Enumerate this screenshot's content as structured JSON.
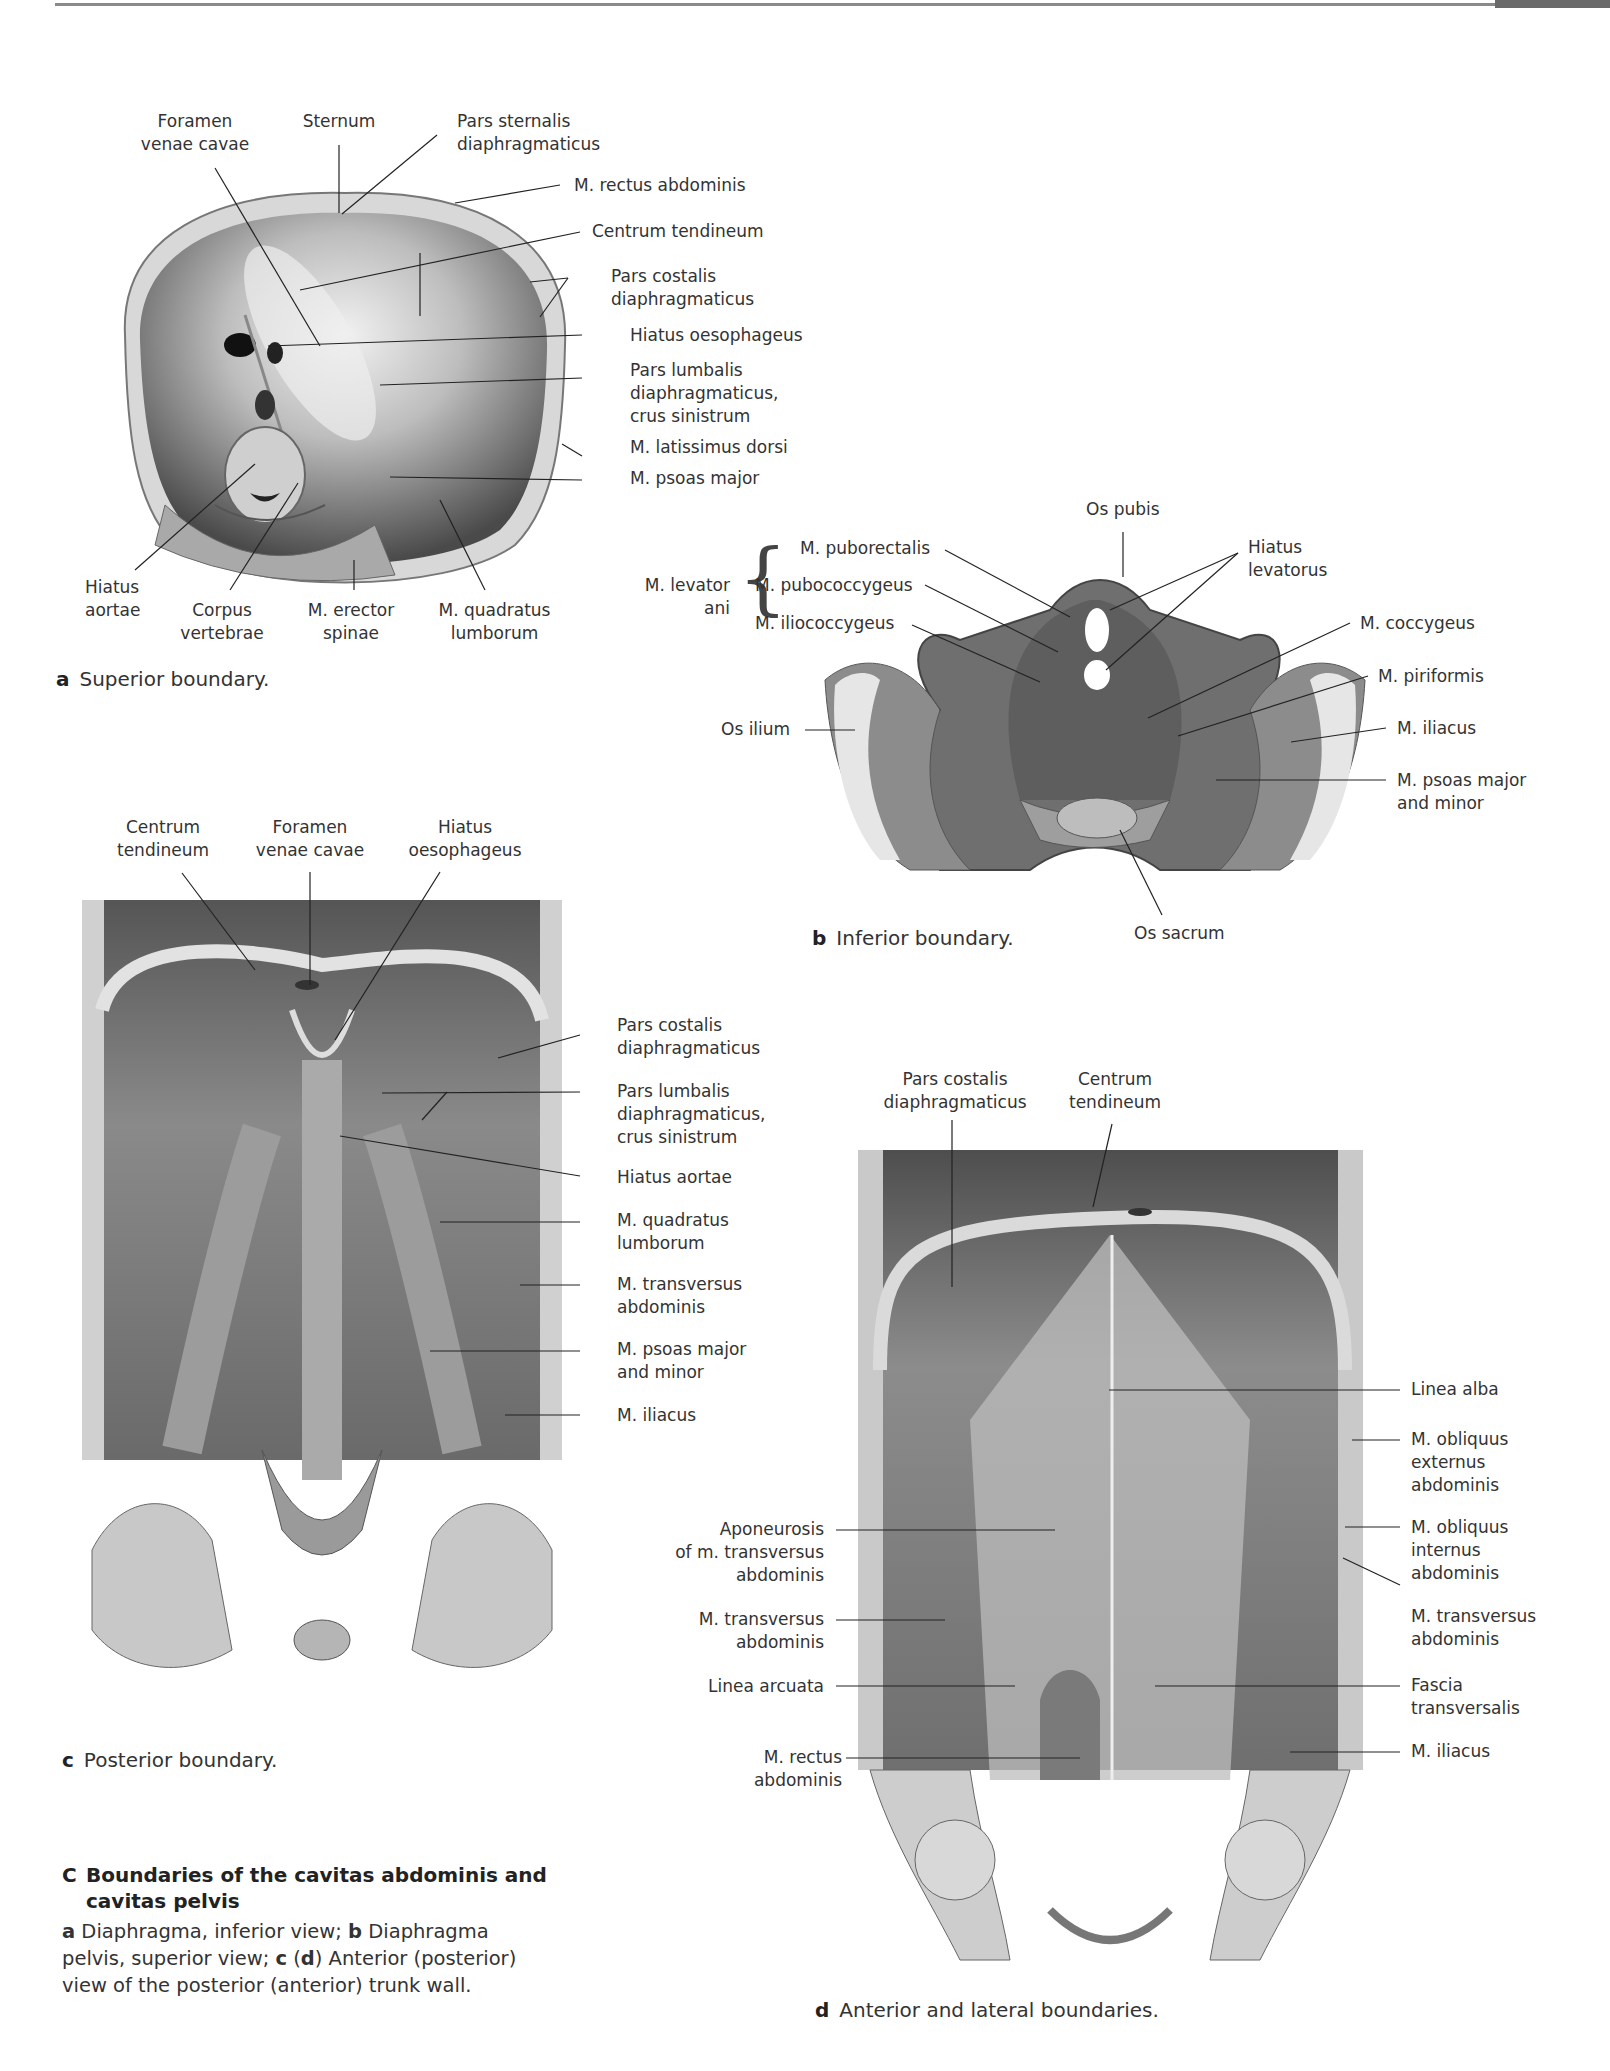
{
  "page": {
    "header_rule": true
  },
  "panel_a": {
    "labels": {
      "foramen_venae_cavae": [
        "Foramen",
        "venae cavae"
      ],
      "sternum": [
        "Sternum"
      ],
      "pars_sternalis": [
        "Pars sternalis",
        "diaphragmaticus"
      ],
      "rectus_abdominis": [
        "M. rectus abdominis"
      ],
      "centrum_tendineum": [
        "Centrum tendineum"
      ],
      "pars_costalis": [
        "Pars costalis",
        "diaphragmaticus"
      ],
      "hiatus_oesophageus": [
        "Hiatus oesophageus"
      ],
      "pars_lumbalis": [
        "Pars lumbalis",
        "diaphragmaticus,",
        "crus sinistrum"
      ],
      "latissimus_dorsi": [
        "M. latissimus dorsi"
      ],
      "psoas_major": [
        "M. psoas major"
      ],
      "hiatus_aortae": [
        "Hiatus",
        "aortae"
      ],
      "corpus_vertebrae": [
        "Corpus",
        "vertebrae"
      ],
      "erector_spinae": [
        "M. erector",
        "spinae"
      ],
      "quadratus_lumborum": [
        "M. quadratus",
        "lumborum"
      ]
    },
    "caption_letter": "a",
    "caption_text": "Superior boundary."
  },
  "panel_b": {
    "labels": {
      "os_pubis": [
        "Os pubis"
      ],
      "levator_ani": [
        "M. levator",
        "ani"
      ],
      "puborectalis": [
        "M. puborectalis"
      ],
      "pubococcygeus": [
        "M. pubococcygeus"
      ],
      "iliococcygeus": [
        "M. iliococcygeus"
      ],
      "hiatus_levatorus": [
        "Hiatus",
        "levatorus"
      ],
      "coccygeus": [
        "M. coccygeus"
      ],
      "piriformis": [
        "M. piriformis"
      ],
      "iliacus": [
        "M. iliacus"
      ],
      "psoas_major_minor": [
        "M. psoas major",
        "and minor"
      ],
      "os_ilium": [
        "Os ilium"
      ],
      "os_sacrum": [
        "Os sacrum"
      ]
    },
    "caption_letter": "b",
    "caption_text": "Inferior boundary."
  },
  "panel_c": {
    "labels": {
      "centrum_tendineum": [
        "Centrum",
        "tendineum"
      ],
      "foramen_venae_cavae": [
        "Foramen",
        "venae cavae"
      ],
      "hiatus_oesophageus": [
        "Hiatus",
        "oesophageus"
      ],
      "pars_costalis": [
        "Pars costalis",
        "diaphragmaticus"
      ],
      "pars_lumbalis": [
        "Pars lumbalis",
        "diaphragmaticus,",
        "crus sinistrum"
      ],
      "hiatus_aortae": [
        "Hiatus aortae"
      ],
      "quadratus_lumborum": [
        "M. quadratus",
        "lumborum"
      ],
      "transversus_abdominis": [
        "M. transversus",
        "abdominis"
      ],
      "psoas_major_minor": [
        "M. psoas major",
        "and minor"
      ],
      "iliacus": [
        "M. iliacus"
      ]
    },
    "caption_letter": "c",
    "caption_text": "Posterior boundary."
  },
  "panel_d": {
    "labels": {
      "pars_costalis": [
        "Pars costalis",
        "diaphragmaticus"
      ],
      "centrum_tendineum": [
        "Centrum",
        "tendineum"
      ],
      "linea_alba": [
        "Linea alba"
      ],
      "obliquus_externus": [
        "M. obliquus",
        "externus",
        "abdominis"
      ],
      "obliquus_internus": [
        "M. obliquus",
        "internus",
        "abdominis"
      ],
      "transversus_abdominis_r": [
        "M. transversus",
        "abdominis"
      ],
      "fascia_transversalis": [
        "Fascia",
        "transversalis"
      ],
      "iliacus": [
        "M. iliacus"
      ],
      "aponeurosis": [
        "Aponeurosis",
        "of m. transversus",
        "abdominis"
      ],
      "transversus_abdominis_l": [
        "M. transversus",
        "abdominis"
      ],
      "linea_arcuata": [
        "Linea arcuata"
      ],
      "rectus_abdominis": [
        "M. rectus",
        "abdominis"
      ]
    },
    "caption_letter": "d",
    "caption_text": "Anterior and lateral boundaries."
  },
  "figure": {
    "letter": "C",
    "title_line1": "Boundaries of the cavitas abdominis and",
    "title_line2": "cavitas pelvis",
    "desc": [
      {
        "b": "a",
        "t": " Diaphragma, inferior view; "
      },
      {
        "b": "b",
        "t": " Diaphragma pelvis, superior view; "
      },
      {
        "b": "c",
        "t": " ("
      },
      {
        "b": "d",
        "t": ")  Anterior (posterior) view of the posterior (anterior) trunk wall."
      }
    ]
  }
}
